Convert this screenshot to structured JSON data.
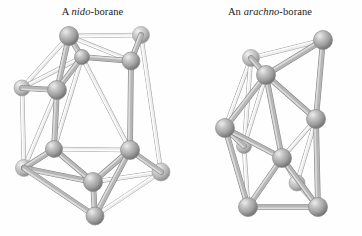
{
  "figure": {
    "background_color": "#fefefe",
    "width": 362,
    "height": 236
  },
  "captions": {
    "left": {
      "prefix": "A ",
      "italic": "nido",
      "suffix": "-borane"
    },
    "right": {
      "prefix": "An ",
      "italic": "arachno",
      "suffix": "-borane"
    }
  },
  "style": {
    "atom_fill_light": "#e2e2e2",
    "atom_fill_mid": "#a8a8a8",
    "atom_fill_dark": "#6e6e6e",
    "atom_stroke": "#8a8a8a",
    "bond_front_color": "#9a9a9a",
    "bond_back_color": "#d8d8d8",
    "bond_stroke": "#8c8c8c",
    "atom_radius_front": 9.5,
    "atom_radius_back": 8.0,
    "bond_width_front": 4.6,
    "bond_width_back": 3.4
  },
  "chart_data": {
    "type": "diagram",
    "subtype": "ball-and-stick molecular cluster",
    "clusters": [
      {
        "name": "nido-borane",
        "label": "A nido-borane",
        "atom_count": 11,
        "bond_count": 24,
        "atoms": [
          {
            "id": "L1",
            "x": 69,
            "y": 36,
            "depth": "front",
            "r": 9.5
          },
          {
            "id": "L2",
            "x": 141,
            "y": 35,
            "depth": "back",
            "r": 8.5
          },
          {
            "id": "L3",
            "x": 131,
            "y": 61,
            "depth": "front",
            "r": 9.0
          },
          {
            "id": "L4",
            "x": 82,
            "y": 57,
            "depth": "front",
            "r": 7.5
          },
          {
            "id": "L5",
            "x": 22,
            "y": 88,
            "depth": "back",
            "r": 8.0
          },
          {
            "id": "L6",
            "x": 57,
            "y": 90,
            "depth": "front",
            "r": 9.5
          },
          {
            "id": "L7",
            "x": 54,
            "y": 149,
            "depth": "front",
            "r": 8.5
          },
          {
            "id": "L8",
            "x": 24,
            "y": 168,
            "depth": "back",
            "r": 8.5
          },
          {
            "id": "L9",
            "x": 130,
            "y": 150,
            "depth": "front",
            "r": 9.5
          },
          {
            "id": "L10",
            "x": 161,
            "y": 172,
            "depth": "back",
            "r": 9.0
          },
          {
            "id": "L11",
            "x": 93,
            "y": 182,
            "depth": "front",
            "r": 9.5
          },
          {
            "id": "L12",
            "x": 95,
            "y": 216,
            "depth": "front",
            "r": 9.0
          }
        ],
        "bonds": [
          {
            "a": "L1",
            "b": "L2",
            "depth": "back"
          },
          {
            "a": "L1",
            "b": "L3",
            "depth": "back"
          },
          {
            "a": "L1",
            "b": "L4",
            "depth": "front"
          },
          {
            "a": "L1",
            "b": "L5",
            "depth": "back"
          },
          {
            "a": "L1",
            "b": "L6",
            "depth": "front"
          },
          {
            "a": "L2",
            "b": "L3",
            "depth": "front"
          },
          {
            "a": "L2",
            "b": "L10",
            "depth": "back"
          },
          {
            "a": "L3",
            "b": "L4",
            "depth": "front"
          },
          {
            "a": "L3",
            "b": "L9",
            "depth": "front"
          },
          {
            "a": "L4",
            "b": "L5",
            "depth": "back"
          },
          {
            "a": "L4",
            "b": "L6",
            "depth": "front"
          },
          {
            "a": "L4",
            "b": "L7",
            "depth": "back"
          },
          {
            "a": "L4",
            "b": "L9",
            "depth": "back"
          },
          {
            "a": "L5",
            "b": "L6",
            "depth": "front"
          },
          {
            "a": "L5",
            "b": "L8",
            "depth": "back"
          },
          {
            "a": "L6",
            "b": "L7",
            "depth": "front"
          },
          {
            "a": "L6",
            "b": "L8",
            "depth": "back"
          },
          {
            "a": "L7",
            "b": "L8",
            "depth": "front"
          },
          {
            "a": "L7",
            "b": "L9",
            "depth": "back"
          },
          {
            "a": "L7",
            "b": "L11",
            "depth": "front"
          },
          {
            "a": "L8",
            "b": "L11",
            "depth": "front"
          },
          {
            "a": "L9",
            "b": "L10",
            "depth": "front"
          },
          {
            "a": "L9",
            "b": "L11",
            "depth": "front"
          },
          {
            "a": "L10",
            "b": "L11",
            "depth": "back"
          },
          {
            "a": "L10",
            "b": "L12",
            "depth": "back"
          },
          {
            "a": "L8",
            "b": "L12",
            "depth": "front"
          },
          {
            "a": "L11",
            "b": "L12",
            "depth": "front"
          },
          {
            "a": "L9",
            "b": "L12",
            "depth": "front"
          }
        ]
      },
      {
        "name": "arachno-borane",
        "label": "An arachno-borane",
        "atom_count": 10,
        "bond_count": 21,
        "atoms": [
          {
            "id": "R1",
            "x": 323,
            "y": 40,
            "depth": "front",
            "r": 9.5
          },
          {
            "id": "R2",
            "x": 251,
            "y": 58,
            "depth": "back",
            "r": 8.5
          },
          {
            "id": "R3",
            "x": 266,
            "y": 75,
            "depth": "front",
            "r": 9.5
          },
          {
            "id": "R4",
            "x": 316,
            "y": 119,
            "depth": "front",
            "r": 9.5
          },
          {
            "id": "R5",
            "x": 225,
            "y": 128,
            "depth": "front",
            "r": 9.5
          },
          {
            "id": "R6",
            "x": 244,
            "y": 146,
            "depth": "back",
            "r": 7.5
          },
          {
            "id": "R7",
            "x": 282,
            "y": 158,
            "depth": "front",
            "r": 9.5
          },
          {
            "id": "R8",
            "x": 248,
            "y": 207,
            "depth": "front",
            "r": 9.5
          },
          {
            "id": "R9",
            "x": 318,
            "y": 207,
            "depth": "front",
            "r": 9.5
          },
          {
            "id": "R10",
            "x": 297,
            "y": 183,
            "depth": "back",
            "r": 8.0
          }
        ],
        "bonds": [
          {
            "a": "R1",
            "b": "R2",
            "depth": "back"
          },
          {
            "a": "R1",
            "b": "R3",
            "depth": "front"
          },
          {
            "a": "R1",
            "b": "R4",
            "depth": "front"
          },
          {
            "a": "R2",
            "b": "R3",
            "depth": "front"
          },
          {
            "a": "R2",
            "b": "R5",
            "depth": "back"
          },
          {
            "a": "R2",
            "b": "R6",
            "depth": "back"
          },
          {
            "a": "R3",
            "b": "R4",
            "depth": "front"
          },
          {
            "a": "R3",
            "b": "R5",
            "depth": "front"
          },
          {
            "a": "R3",
            "b": "R6",
            "depth": "back"
          },
          {
            "a": "R3",
            "b": "R7",
            "depth": "front"
          },
          {
            "a": "R4",
            "b": "R7",
            "depth": "back"
          },
          {
            "a": "R4",
            "b": "R9",
            "depth": "front"
          },
          {
            "a": "R4",
            "b": "R10",
            "depth": "back"
          },
          {
            "a": "R5",
            "b": "R6",
            "depth": "front"
          },
          {
            "a": "R5",
            "b": "R7",
            "depth": "front"
          },
          {
            "a": "R5",
            "b": "R8",
            "depth": "front"
          },
          {
            "a": "R6",
            "b": "R8",
            "depth": "back"
          },
          {
            "a": "R7",
            "b": "R8",
            "depth": "front"
          },
          {
            "a": "R7",
            "b": "R9",
            "depth": "front"
          },
          {
            "a": "R7",
            "b": "R10",
            "depth": "back"
          },
          {
            "a": "R8",
            "b": "R9",
            "depth": "front"
          },
          {
            "a": "R9",
            "b": "R10",
            "depth": "back"
          }
        ]
      }
    ]
  }
}
